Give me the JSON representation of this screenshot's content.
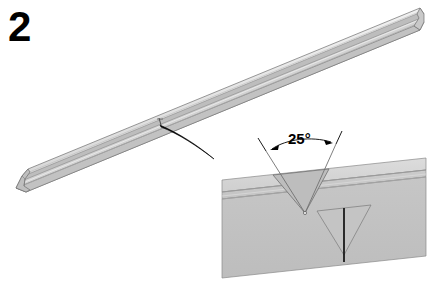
{
  "figure": {
    "step_number": "2",
    "background_color": "#ffffff"
  },
  "rail": {
    "name": "c-channel-rail",
    "body_fill": "#d4d4d4",
    "top_face_fill": "#e8e8e8",
    "shadow_fill": "#b0b0b0",
    "outline_color": "#6e6e6e",
    "notch_mark_color": "#555555"
  },
  "leader": {
    "name": "curved-leader-arrow",
    "color": "#000000"
  },
  "detail_panel": {
    "name": "detail-callout-panel",
    "panel_fill": "#c8c8c8",
    "panel_top_band_fill": "#d6d6d6",
    "panel_lower_band_fill": "#c0c0c0",
    "band_line_color": "#9a9a9a",
    "outline_color": "#8a8a8a",
    "notch_fill": "#bdbdbd",
    "notch_outline_color": "#707070",
    "seam_line_color": "#1a1a1a"
  },
  "dimension": {
    "name": "angle-dimension",
    "angle_label": "25°",
    "line_color": "#000000",
    "arrow_color": "#000000"
  }
}
